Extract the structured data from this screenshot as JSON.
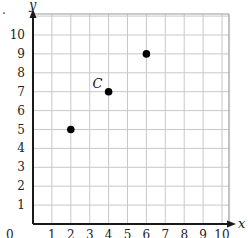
{
  "prefix_mark": ".",
  "chart_data": {
    "type": "scatter",
    "title": "",
    "xlabel": "x",
    "ylabel": "y",
    "xlim": [
      0,
      10
    ],
    "ylim": [
      0,
      10
    ],
    "grid": true,
    "x_ticks": [
      "0",
      "1",
      "2",
      "3",
      "4",
      "5",
      "6",
      "7",
      "8",
      "9",
      "10"
    ],
    "y_ticks": [
      "1",
      "2",
      "3",
      "4",
      "5",
      "6",
      "7",
      "8",
      "9",
      "10"
    ],
    "points": [
      {
        "x": 2,
        "y": 5,
        "label": ""
      },
      {
        "x": 4,
        "y": 7,
        "label": "C"
      },
      {
        "x": 6,
        "y": 9,
        "label": ""
      }
    ]
  },
  "layout": {
    "origin_px": [
      33,
      224
    ],
    "unit_px": 18.9,
    "grid_right_px": 229,
    "grid_top_px": 14,
    "grid_color": "#c8c8c8",
    "axis_color": "#1a1a1a",
    "point_color": "#000000"
  }
}
